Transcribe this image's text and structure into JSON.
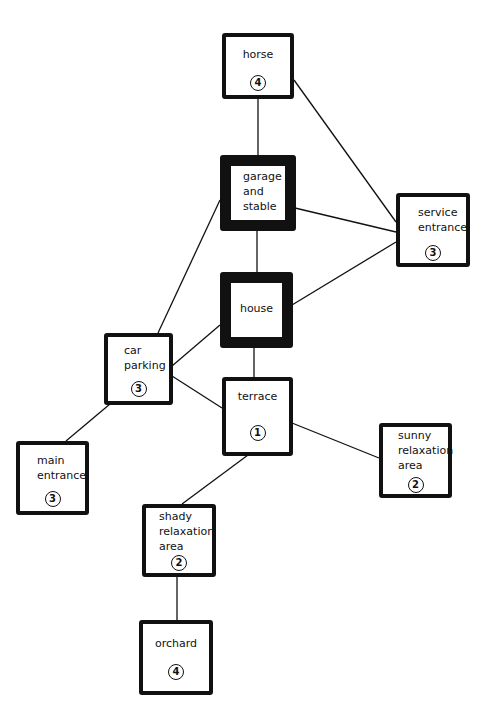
{
  "diagram": {
    "type": "bubble-relationship-diagram",
    "nodes": [
      {
        "id": "horse",
        "label": "horse",
        "priority": "4",
        "emphasis": "normal"
      },
      {
        "id": "garage",
        "label": "garage\nand\nstable",
        "priority": null,
        "emphasis": "heavy"
      },
      {
        "id": "service",
        "label": "service\nentrance",
        "priority": "3",
        "emphasis": "normal"
      },
      {
        "id": "house",
        "label": "house",
        "priority": null,
        "emphasis": "heavy"
      },
      {
        "id": "parking",
        "label": "car\nparking",
        "priority": "3",
        "emphasis": "normal"
      },
      {
        "id": "terrace",
        "label": "terrace",
        "priority": "1",
        "emphasis": "normal"
      },
      {
        "id": "main",
        "label": "main\nentrance",
        "priority": "3",
        "emphasis": "normal"
      },
      {
        "id": "sunny",
        "label": "sunny\nrelaxation\narea",
        "priority": "2",
        "emphasis": "normal"
      },
      {
        "id": "shady",
        "label": "shady\nrelaxation\narea",
        "priority": "2",
        "emphasis": "normal"
      },
      {
        "id": "orchard",
        "label": "orchard",
        "priority": "4",
        "emphasis": "normal"
      }
    ],
    "edges": [
      [
        "horse",
        "garage"
      ],
      [
        "horse",
        "service"
      ],
      [
        "garage",
        "service"
      ],
      [
        "garage",
        "house"
      ],
      [
        "garage",
        "parking"
      ],
      [
        "house",
        "service"
      ],
      [
        "house",
        "parking"
      ],
      [
        "house",
        "terrace"
      ],
      [
        "parking",
        "terrace"
      ],
      [
        "parking",
        "main"
      ],
      [
        "terrace",
        "sunny"
      ],
      [
        "terrace",
        "shady"
      ],
      [
        "shady",
        "orchard"
      ]
    ],
    "colors": {
      "line": "#111111",
      "background": "#ffffff"
    }
  }
}
